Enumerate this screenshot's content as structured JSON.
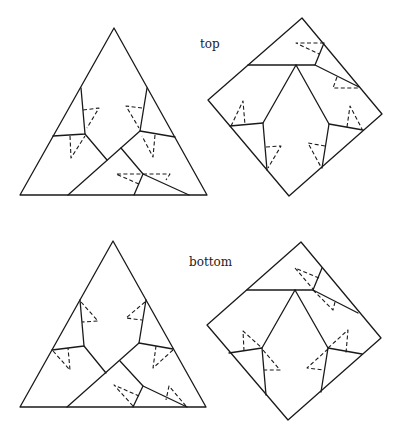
{
  "labels": {
    "top": "top",
    "bottom": "bottom"
  },
  "figure": {
    "panels": [
      {
        "name": "top-triangle",
        "view": "top",
        "shape": "triangle"
      },
      {
        "name": "top-square",
        "view": "top",
        "shape": "square"
      },
      {
        "name": "bottom-triangle",
        "view": "bottom",
        "shape": "triangle"
      },
      {
        "name": "bottom-square",
        "view": "bottom",
        "shape": "square"
      }
    ]
  },
  "colors": {
    "stroke": "#1a1a1a",
    "background": "#ffffff"
  }
}
